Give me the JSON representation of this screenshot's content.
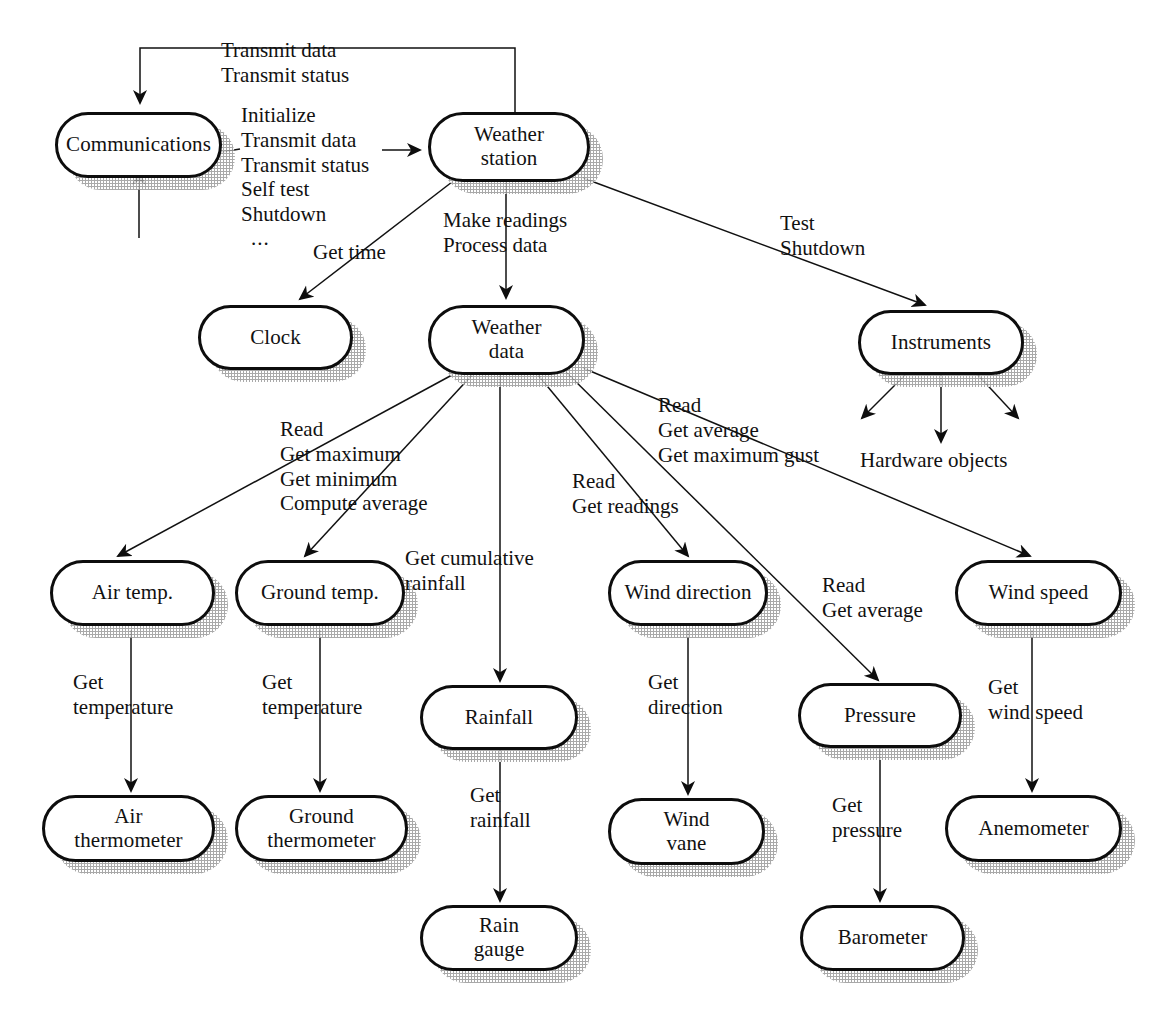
{
  "diagram": {
    "type": "object-aggregation-diagram",
    "stroke_color": "#0d0d0d",
    "shadow_color": "#9b9b9b",
    "background": "#ffffff"
  },
  "nodes": {
    "communications": "Communications",
    "weather_station": "Weather\nstation",
    "clock": "Clock",
    "weather_data": "Weather\ndata",
    "instruments": "Instruments",
    "air_temp": "Air temp.",
    "ground_temp": "Ground temp.",
    "rainfall": "Rainfall",
    "wind_direction": "Wind direction",
    "pressure": "Pressure",
    "wind_speed": "Wind speed",
    "air_thermometer": "Air\nthermometer",
    "ground_thermometer": "Ground\nthermometer",
    "rain_gauge": "Rain\ngauge",
    "wind_vane": "Wind\nvane",
    "anemometer": "Anemometer",
    "barometer": "Barometer"
  },
  "edge_labels": {
    "station_to_comms": "Transmit data\nTransmit status",
    "comms_services": "Initialize\nTransmit data\nTransmit status\nSelf test\nShutdown",
    "comms_ellipsis": "...",
    "get_time": "Get time",
    "station_to_data": "Make readings\nProcess data",
    "station_to_instruments": "Test\nShutdown",
    "data_to_temp": "Read\nGet maximum\nGet minimum\nCompute average",
    "data_to_rainfall": "Get cumulative\nrainfall",
    "data_to_wind_direction": "Read\nGet readings",
    "data_to_wind_speed": "Read\nGet average\nGet maximum gust",
    "data_to_pressure": "Read\nGet average",
    "hardware_objects": "Hardware objects",
    "air_get_temperature": "Get\ntemperature",
    "ground_get_temperature": "Get\ntemperature",
    "get_rainfall": "Get\nrainfall",
    "get_direction": "Get\ndirection",
    "get_pressure": "Get\npressure",
    "get_wind_speed": "Get\nwind speed"
  }
}
